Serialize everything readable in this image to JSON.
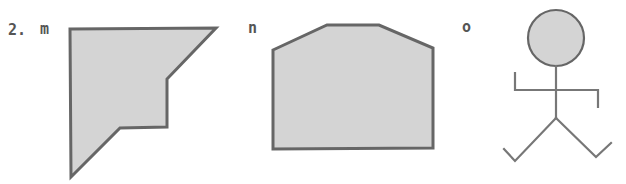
{
  "problem_number": "2.",
  "colors": {
    "fill": "#d4d4d4",
    "stroke": "#666666",
    "text": "#555555"
  },
  "figures": [
    {
      "label": "m",
      "type": "polygon",
      "description": "irregular hexagon with notch (arrow-like corner shape)",
      "points": "70,29 216,28 167,79 167,127 120,128 71,177"
    },
    {
      "label": "n",
      "type": "polygon",
      "description": "pentagon-like house shape with flat top (hexagon)",
      "points": "273,50 327,25 379,25 433,48 433,148 273,149"
    },
    {
      "label": "o",
      "type": "stick-figure",
      "description": "stick figure with circular shaded head",
      "head": {
        "cx": 556,
        "cy": 38,
        "r": 28
      }
    }
  ]
}
